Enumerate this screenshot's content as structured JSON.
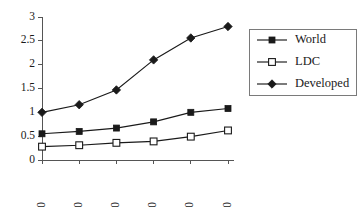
{
  "chart_data": {
    "type": "line",
    "title": "",
    "subtitle": "",
    "xlabel": "",
    "ylabel": "",
    "categories": [
      "1950",
      "1960",
      "1970",
      "1980",
      "1990",
      "2000"
    ],
    "x_tick_labels": [
      "1950",
      "1960",
      "1970",
      "1980",
      "1990",
      "2000"
    ],
    "x_tick_rotation": -90,
    "y_tick_labels": [
      "0",
      "0.5",
      "1",
      "1.5",
      "2",
      "2.5",
      "3"
    ],
    "y_ticks": [
      0,
      0.5,
      1,
      1.5,
      2,
      2.5,
      3
    ],
    "ylim": [
      0,
      3
    ],
    "grid": false,
    "legend_position": "right",
    "series": [
      {
        "name": "World",
        "marker": "filled-square",
        "color": "#1a1a1a",
        "values": [
          0.55,
          0.6,
          0.67,
          0.8,
          1.0,
          1.08
        ]
      },
      {
        "name": "LDC",
        "marker": "open-square",
        "color": "#1a1a1a",
        "values": [
          0.28,
          0.31,
          0.36,
          0.39,
          0.49,
          0.62
        ]
      },
      {
        "name": "Developed",
        "marker": "filled-diamond",
        "color": "#1a1a1a",
        "values": [
          1.0,
          1.16,
          1.47,
          2.1,
          2.56,
          2.8
        ]
      }
    ]
  },
  "legend": {
    "entries": [
      {
        "label": "World"
      },
      {
        "label": "LDC"
      },
      {
        "label": "Developed"
      }
    ]
  }
}
